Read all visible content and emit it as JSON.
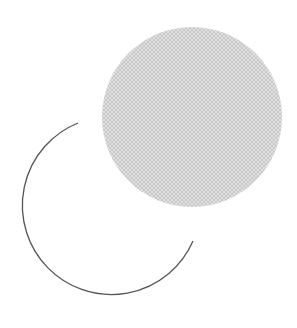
{
  "figure": {
    "shapes": [
      {
        "name": "filled-circle",
        "kind": "circle",
        "fill": "#c8c8c8",
        "pattern": "crosshatch",
        "pattern_color": "#e6e6e6"
      },
      {
        "name": "open-arc",
        "kind": "arc",
        "stroke": "#555555"
      }
    ]
  }
}
